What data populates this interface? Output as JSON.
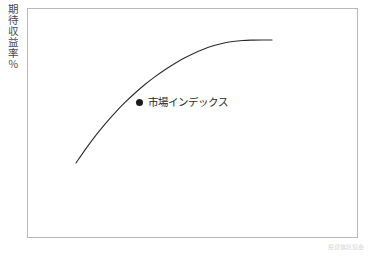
{
  "figure": {
    "background_color": "#ffffff",
    "frame_color": "#b6b8ba"
  },
  "axes": {
    "y_caption": "期待収益率％"
  },
  "legend": {
    "marker_icon": "filled-circle-marker",
    "label": "市場インデックス",
    "marker_color": "#1b1b1b"
  },
  "footer": {
    "caption": "投資信託協会"
  },
  "chart_data": {
    "type": "line",
    "title": "",
    "subtitle": "",
    "xlabel": "",
    "ylabel": "期待収益率％",
    "grid": false,
    "legend_position": "inside-center",
    "series": [
      {
        "name": "市場インデックス",
        "color": "#2b2b2b",
        "line_width": 1.1,
        "x": [
          0,
          0.05,
          0.1,
          0.15,
          0.2,
          0.25,
          0.3,
          0.35,
          0.4,
          0.45,
          0.5,
          0.55,
          0.6,
          0.65,
          0.7,
          0.75,
          0.8,
          0.85,
          0.9,
          0.95,
          1.0
        ],
        "y": [
          0.0,
          0.115,
          0.222,
          0.32,
          0.41,
          0.492,
          0.567,
          0.636,
          0.698,
          0.754,
          0.805,
          0.851,
          0.891,
          0.925,
          0.953,
          0.974,
          0.988,
          0.996,
          0.999,
          1.0,
          1.0
        ]
      }
    ],
    "annotations": [
      {
        "text": "市場インデックス",
        "marker": "filled-circle",
        "x_px": 141,
        "y_px": 102
      }
    ],
    "axis_ranges": {
      "x": [
        0,
        1
      ],
      "y": [
        0,
        1
      ]
    },
    "pixel_geometry": {
      "frame_left": 27,
      "frame_top": 8,
      "frame_right": 358,
      "frame_bottom": 238,
      "curve_start": [
        76,
        163
      ],
      "curve_end": [
        272,
        40
      ]
    }
  }
}
